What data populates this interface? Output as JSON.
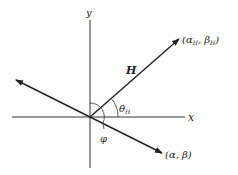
{
  "diagram": {
    "type": "vector-angle-diagram",
    "axes": {
      "x_label": "x",
      "y_label": "y"
    },
    "vectors": [
      {
        "name": "H",
        "label": "H",
        "endpoint_label": "(αH, βH)",
        "endpoint_main": "(α",
        "endpoint_sub1": "H",
        "endpoint_mid": ", β",
        "endpoint_sub2": "H",
        "endpoint_close": ")"
      },
      {
        "name": "alpha-beta",
        "endpoint_label": "(α, β)"
      },
      {
        "name": "opposite",
        "endpoint_label": ""
      }
    ],
    "angles": {
      "theta_main": "θ",
      "theta_sub": "H",
      "phi": "φ"
    },
    "colors": {
      "line": "#222222",
      "background": "#ffffff"
    }
  }
}
